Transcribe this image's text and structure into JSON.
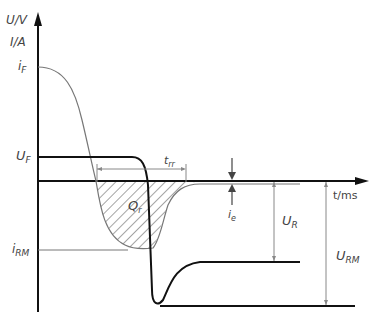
{
  "axes": {
    "y_label_top": "U/V",
    "y_label_bottom": "I/A",
    "x_label": "t/ms"
  },
  "labels": {
    "i_F": {
      "main": "i",
      "sub": "F"
    },
    "U_F": {
      "main": "U",
      "sub": "F"
    },
    "i_RM": {
      "main": "i",
      "sub": "RM"
    },
    "t_rr": {
      "main": "t",
      "sub": "rr"
    },
    "Q_r": {
      "main": "Q",
      "sub": "r"
    },
    "i_e": {
      "main": "i",
      "sub": "e"
    },
    "U_R": {
      "main": "U",
      "sub": "R"
    },
    "U_RM": {
      "main": "U",
      "sub": "RM"
    }
  },
  "colors": {
    "axis": "#111111",
    "voltage_curve": "#111111",
    "current_curve": "#777777",
    "dimension": "#888888",
    "hatch": "#666666"
  }
}
